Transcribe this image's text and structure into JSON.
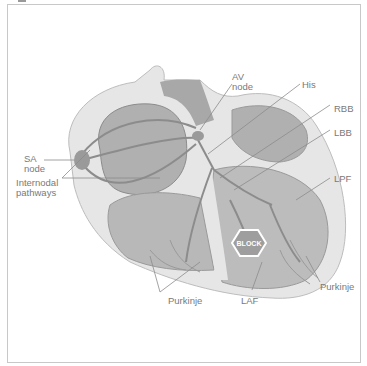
{
  "figure": {
    "labels": {
      "sa_node": "SA\nnode",
      "internodal": "Internodal\npathways",
      "av_node": "AV\nnode",
      "his": "His",
      "rbb": "RBB",
      "lbb": "LBB",
      "lpf": "LPF",
      "purkinje_left": "Purkinje",
      "laf": "LAF",
      "purkinje_right": "Purkinje"
    },
    "block_badge": "BLOCK",
    "colors": {
      "outline": "#c8c8c8",
      "label_text": "#7a7a7a",
      "heart_outer": "#e6e6e6",
      "heart_mid": "#b4b4b4",
      "heart_dark": "#9a9a9a",
      "pathway": "#8c8c8c",
      "block": "#9e9e9e"
    }
  }
}
